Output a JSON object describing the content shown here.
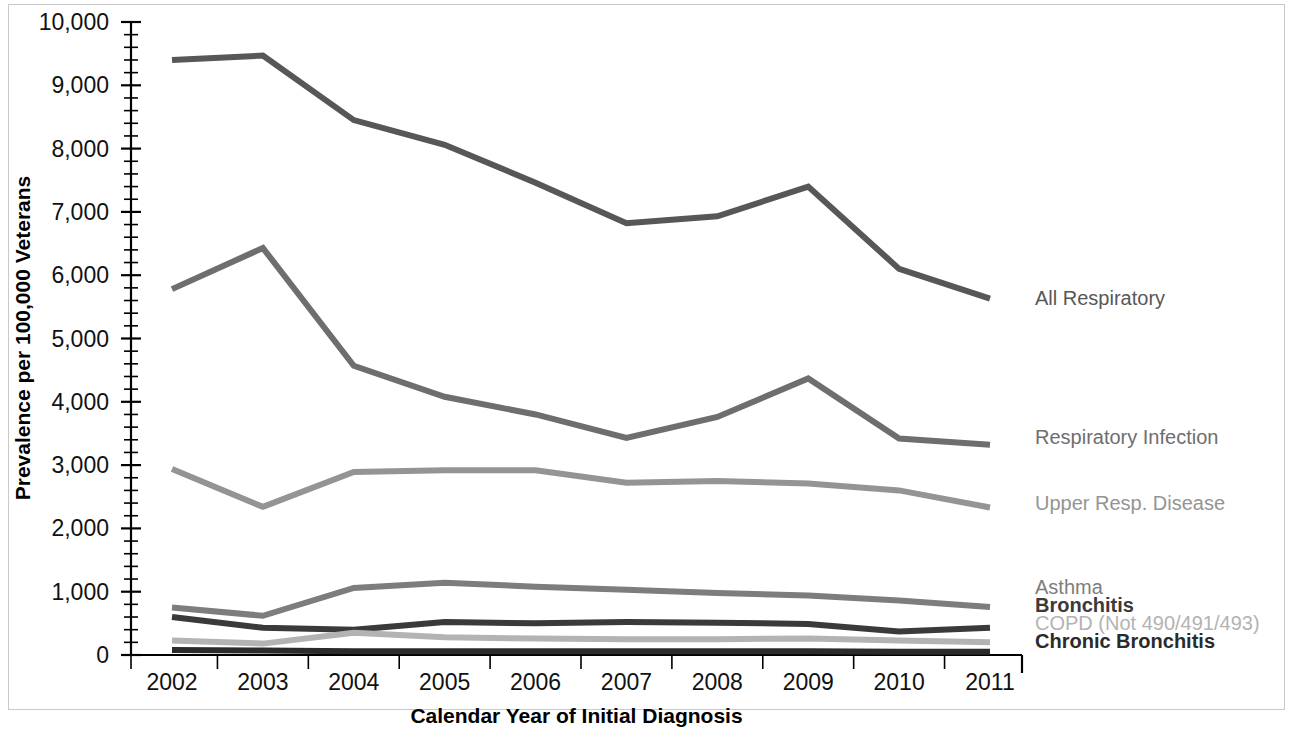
{
  "chart_data": {
    "type": "line",
    "title": "",
    "xlabel": "Calendar Year of Initial Diagnosis",
    "ylabel": "Prevalence per 100,000 Veterans",
    "categories": [
      "2002",
      "2003",
      "2004",
      "2005",
      "2006",
      "2007",
      "2008",
      "2009",
      "2010",
      "2011"
    ],
    "x": [
      2002,
      2003,
      2004,
      2005,
      2006,
      2007,
      2008,
      2009,
      2010,
      2011
    ],
    "ylim": [
      0,
      10000
    ],
    "yticks": [
      0,
      1000,
      2000,
      3000,
      4000,
      5000,
      6000,
      7000,
      8000,
      9000,
      10000
    ],
    "ytick_labels": [
      "0",
      "1,000",
      "2,000",
      "3,000",
      "4,000",
      "5,000",
      "6,000",
      "7,000",
      "8,000",
      "9,000",
      "10,000"
    ],
    "minor_ticks_per_interval": 5,
    "grid": false,
    "legend_position": "right-inline",
    "series": [
      {
        "name": "All Respiratory",
        "color": "#575757",
        "width": 6,
        "label_y": 305,
        "values": [
          9400,
          9470,
          8450,
          8060,
          7460,
          6820,
          6930,
          7400,
          6100,
          5630
        ]
      },
      {
        "name": "Respiratory Infection",
        "color": "#6e6e6e",
        "width": 6,
        "label_y": 444,
        "values": [
          5780,
          6430,
          4570,
          4080,
          3800,
          3430,
          3760,
          4370,
          3420,
          3320
        ]
      },
      {
        "name": "Upper Resp. Disease",
        "color": "#949494",
        "width": 6,
        "label_y": 510,
        "values": [
          2940,
          2340,
          2890,
          2920,
          2920,
          2720,
          2750,
          2710,
          2600,
          2330
        ]
      },
      {
        "name": "Asthma",
        "color": "#7d7d7d",
        "width": 6,
        "label_y": 594,
        "values": [
          750,
          620,
          1060,
          1140,
          1080,
          1030,
          980,
          940,
          860,
          760
        ]
      },
      {
        "name": "Bronchitis",
        "color": "#3a3a3a",
        "width": 6,
        "label_y": 612,
        "values": [
          600,
          430,
          400,
          520,
          500,
          520,
          510,
          490,
          370,
          430
        ]
      },
      {
        "name": "COPD (Not 490/491/493)",
        "color": "#b3b3b3",
        "width": 6,
        "label_y": 630,
        "values": [
          230,
          180,
          350,
          280,
          260,
          250,
          250,
          260,
          230,
          200
        ]
      },
      {
        "name": "Chronic Bronchitis",
        "color": "#2b2b2b",
        "width": 6,
        "label_y": 648,
        "values": [
          80,
          70,
          60,
          60,
          60,
          60,
          60,
          60,
          50,
          50
        ]
      }
    ]
  }
}
